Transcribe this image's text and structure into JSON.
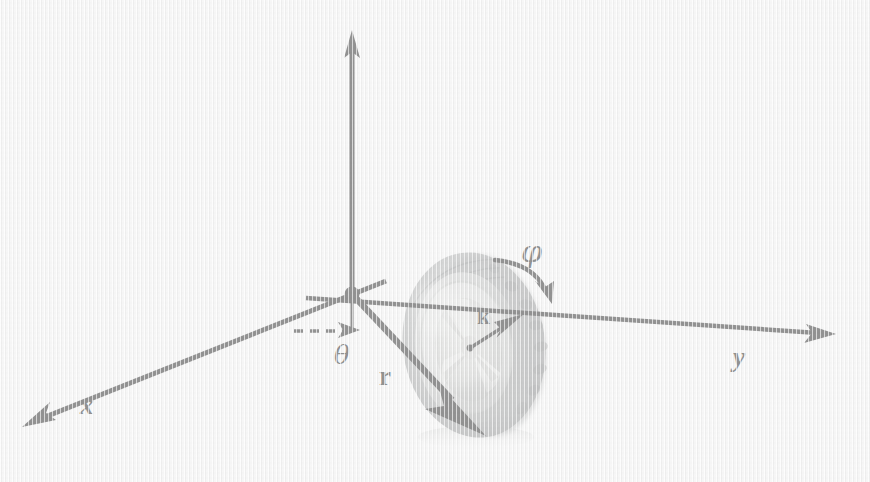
{
  "figure": {
    "background_color": "#f3f3f3",
    "ink_color": "#101010",
    "width": 870,
    "height": 482
  },
  "labels": {
    "x_axis": "x",
    "y_axis": "y",
    "z_axis": "",
    "r_vector": "r",
    "k_vector": "k",
    "theta_angle": "θ",
    "phi_angle": "φ"
  },
  "geometry": {
    "origin": {
      "x": 352,
      "y": 294
    },
    "z_axis_tip": {
      "x": 352,
      "y": 32
    },
    "y_axis_tip": {
      "x": 834,
      "y": 332
    },
    "x_axis_tip": {
      "x": 22,
      "y": 428
    },
    "r_vector_tip": {
      "x": 484,
      "y": 434
    },
    "k_vector_origin": {
      "x": 472,
      "y": 347
    },
    "k_vector_tip": {
      "x": 521,
      "y": 316
    },
    "theta_dash_start": {
      "x": 296,
      "y": 331
    },
    "theta_dash_tip": {
      "x": 357,
      "y": 330
    },
    "phi_arc_start": {
      "x": 497,
      "y": 261
    },
    "phi_arc_tip": {
      "x": 551,
      "y": 300
    }
  },
  "wheel": {
    "name": "tire",
    "center": {
      "x": 474,
      "y": 345
    },
    "outer_radius_x": 72,
    "outer_radius_y": 94,
    "rotation_deg": -8,
    "tread_color": "#8f9192",
    "sidewall_color": "#b9bbbb",
    "rim_color": "#d8d9d8",
    "hub_color": "#c6c7c6"
  },
  "colors": {
    "paper": "#f3f3f3",
    "ink": "#101010",
    "tire_dark": "#7d7f80",
    "tire_mid": "#a4a6a6",
    "tire_light": "#d3d4d3"
  }
}
